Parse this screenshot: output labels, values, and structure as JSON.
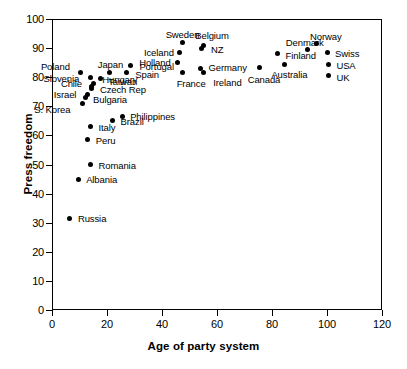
{
  "chart_data": {
    "type": "scatter",
    "title": "",
    "xlabel": "Age of party system",
    "ylabel": "Press freedom",
    "xlim": [
      0,
      120
    ],
    "ylim": [
      0,
      100
    ],
    "xticks": [
      0,
      20,
      40,
      60,
      80,
      100,
      120
    ],
    "yticks": [
      0,
      10,
      20,
      30,
      40,
      50,
      60,
      70,
      80,
      90,
      100
    ],
    "grid": false,
    "legend": "none",
    "points": [
      {
        "label": "Russia",
        "x": 6.5,
        "y": 31.5,
        "label_dx": 8,
        "label_dy": -4
      },
      {
        "label": "Albania",
        "x": 9.5,
        "y": 45.0,
        "label_dx": 8,
        "label_dy": -4
      },
      {
        "label": "Romania",
        "x": 14.0,
        "y": 50.0,
        "label_dx": 8,
        "label_dy": -4
      },
      {
        "label": "Peru",
        "x": 13.0,
        "y": 58.5,
        "label_dx": 8,
        "label_dy": -4
      },
      {
        "label": "Italy",
        "x": 14.0,
        "y": 63.0,
        "label_dx": 8,
        "label_dy": -4
      },
      {
        "label": "Brazil",
        "x": 22.0,
        "y": 65.0,
        "label_dx": 8,
        "label_dy": -4
      },
      {
        "label": "Philippines",
        "x": 25.5,
        "y": 66.5,
        "label_dx": 8,
        "label_dy": -4
      },
      {
        "label": "S. Korea",
        "x": 11.0,
        "y": 71.0,
        "label_dx": -48,
        "label_dy": 2
      },
      {
        "label": "Bulgaria",
        "x": 12.0,
        "y": 73.0,
        "label_dx": 8,
        "label_dy": -3
      },
      {
        "label": "Israel",
        "x": 13.0,
        "y": 74.0,
        "label_dx": -34,
        "label_dy": -5
      },
      {
        "label": "Czech Rep",
        "x": 14.5,
        "y": 76.0,
        "label_dx": 8,
        "label_dy": -4
      },
      {
        "label": "Chile",
        "x": 14.5,
        "y": 76.8,
        "label_dx": -31,
        "label_dy": -8
      },
      {
        "label": "Hungary",
        "x": 15.0,
        "y": 78.0,
        "label_dx": 9,
        "label_dy": -8
      },
      {
        "label": "Taiwan",
        "x": 17.5,
        "y": 79.5,
        "label_dx": 8,
        "label_dy": -2
      },
      {
        "label": "Slovenia",
        "x": 14.0,
        "y": 79.8,
        "label_dx": -47,
        "label_dy": -4
      },
      {
        "label": "Poland",
        "x": 10.5,
        "y": 81.5,
        "label_dx": -40,
        "label_dy": -11
      },
      {
        "label": "Japan",
        "x": 21.0,
        "y": 81.5,
        "label_dx": -12,
        "label_dy": -13
      },
      {
        "label": "Spain",
        "x": 27.0,
        "y": 81.5,
        "label_dx": 9,
        "label_dy": -3
      },
      {
        "label": "Portugal",
        "x": 28.5,
        "y": 84.0,
        "label_dx": 9,
        "label_dy": -4
      },
      {
        "label": "France",
        "x": 47.5,
        "y": 81.5,
        "label_dx": -6,
        "label_dy": 6
      },
      {
        "label": "Holland",
        "x": 45.5,
        "y": 85.0,
        "label_dx": -38,
        "label_dy": -5
      },
      {
        "label": "Iceland",
        "x": 46.5,
        "y": 88.5,
        "label_dx": -36,
        "label_dy": -4
      },
      {
        "label": "Sweden",
        "x": 47.5,
        "y": 92.0,
        "label_dx": -17,
        "label_dy": -12
      },
      {
        "label": "Germany",
        "x": 54.0,
        "y": 83.0,
        "label_dx": 8,
        "label_dy": -5
      },
      {
        "label": "Ireland",
        "x": 55.0,
        "y": 81.5,
        "label_dx": 10,
        "label_dy": 5
      },
      {
        "label": "NZ",
        "x": 54.5,
        "y": 90.0,
        "label_dx": 9,
        "label_dy": -3
      },
      {
        "label": "Belgium",
        "x": 55.0,
        "y": 91.0,
        "label_dx": -8,
        "label_dy": -14
      },
      {
        "label": "Canada",
        "x": 75.5,
        "y": 83.5,
        "label_dx": -12,
        "label_dy": 8
      },
      {
        "label": "Australia",
        "x": 84.5,
        "y": 84.5,
        "label_dx": -13,
        "label_dy": 6
      },
      {
        "label": "Finland",
        "x": 82.0,
        "y": 88.0,
        "label_dx": 8,
        "label_dy": -3
      },
      {
        "label": "Denmark",
        "x": 93.0,
        "y": 89.5,
        "label_dx": -22,
        "label_dy": -12
      },
      {
        "label": "Norway",
        "x": 96.0,
        "y": 91.5,
        "label_dx": -6,
        "label_dy": -12
      },
      {
        "label": "Swiss",
        "x": 100.0,
        "y": 88.5,
        "label_dx": 8,
        "label_dy": -3
      },
      {
        "label": "USA",
        "x": 100.5,
        "y": 84.5,
        "label_dx": 8,
        "label_dy": -3
      },
      {
        "label": "UK",
        "x": 100.5,
        "y": 80.5,
        "label_dx": 8,
        "label_dy": -3
      }
    ]
  }
}
